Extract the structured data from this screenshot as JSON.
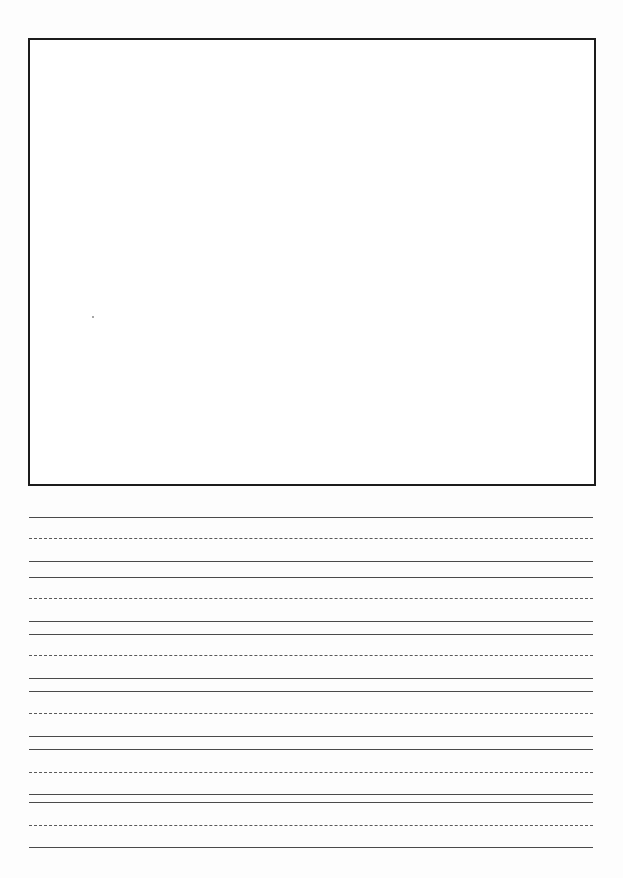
{
  "document": {
    "type": "handwriting-practice-sheet",
    "width": 623,
    "height": 878,
    "colors": {
      "background": "#ffffff",
      "box_border": "#1c1c1c",
      "solid_line": "#4a4a4a",
      "dashed_line": "#5a5a5a"
    }
  },
  "drawing_box": {
    "left": 28,
    "top": 38,
    "width": 568,
    "height": 448
  },
  "speck": {
    "x": 92,
    "y": 316
  },
  "writing_lines": {
    "left": 29,
    "right": 593,
    "groups": [
      {
        "top": 517,
        "mid": 538,
        "base": 561
      },
      {
        "top": 577,
        "mid": 598,
        "base": 621
      },
      {
        "top": 634,
        "mid": 655,
        "base": 678
      },
      {
        "top": 691,
        "mid": 713,
        "base": 736
      },
      {
        "top": 749,
        "mid": 772,
        "base": 794
      },
      {
        "top": 802,
        "mid": 825,
        "base": 847
      }
    ]
  }
}
